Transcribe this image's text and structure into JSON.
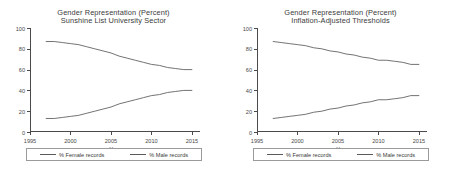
{
  "figure": {
    "background": "#ffffff",
    "line_color": "#5a5a5a",
    "axis_color": "#4a4a4a",
    "text_color": "#3a3a3a"
  },
  "panels": [
    {
      "id": "left",
      "title_line1": "Gender Representation (Percent)",
      "title_line2": "Sunshine List University Sector",
      "xlabel": "Year",
      "legend": [
        {
          "label": "% Female records"
        },
        {
          "label": "% Male records"
        }
      ]
    },
    {
      "id": "right",
      "title_line1": "Gender Representation (Percent)",
      "title_line2": "Inflation-Adjusted Thresholds",
      "xlabel": "Year",
      "legend": [
        {
          "label": "% Female records"
        },
        {
          "label": "% Male records"
        }
      ]
    }
  ],
  "chart_data": [
    {
      "type": "line",
      "title": "Gender Representation (Percent) — Sunshine List University Sector",
      "xlabel": "Year",
      "ylabel": "",
      "xlim": [
        1995,
        2016
      ],
      "ylim": [
        0,
        100
      ],
      "xticks": [
        1995,
        2000,
        2005,
        2010,
        2015
      ],
      "yticks": [
        0,
        20,
        40,
        60,
        80,
        100
      ],
      "grid": false,
      "legend_position": "bottom",
      "x": [
        1997,
        1998,
        1999,
        2000,
        2001,
        2002,
        2003,
        2004,
        2005,
        2006,
        2007,
        2008,
        2009,
        2010,
        2011,
        2012,
        2013,
        2014,
        2015
      ],
      "series": [
        {
          "name": "% Female records",
          "values": [
            87,
            87,
            86,
            85,
            84,
            82,
            80,
            78,
            76,
            73,
            71,
            69,
            67,
            65,
            64,
            62,
            61,
            60,
            60
          ]
        },
        {
          "name": "% Male records",
          "values": [
            13,
            13,
            14,
            15,
            16,
            18,
            20,
            22,
            24,
            27,
            29,
            31,
            33,
            35,
            36,
            38,
            39,
            40,
            40
          ]
        }
      ]
    },
    {
      "type": "line",
      "title": "Gender Representation (Percent) — Inflation-Adjusted Thresholds",
      "xlabel": "Year",
      "ylabel": "",
      "xlim": [
        1995,
        2016
      ],
      "ylim": [
        0,
        100
      ],
      "xticks": [
        1995,
        2000,
        2005,
        2010,
        2015
      ],
      "yticks": [
        0,
        20,
        40,
        60,
        80,
        100
      ],
      "grid": false,
      "legend_position": "bottom",
      "x": [
        1997,
        1998,
        1999,
        2000,
        2001,
        2002,
        2003,
        2004,
        2005,
        2006,
        2007,
        2008,
        2009,
        2010,
        2011,
        2012,
        2013,
        2014,
        2015
      ],
      "series": [
        {
          "name": "% Female records",
          "values": [
            87,
            86,
            85,
            84,
            83,
            81,
            80,
            78,
            77,
            75,
            74,
            72,
            71,
            69,
            69,
            68,
            67,
            65,
            65
          ]
        },
        {
          "name": "% Male records",
          "values": [
            13,
            14,
            15,
            16,
            17,
            19,
            20,
            22,
            23,
            25,
            26,
            28,
            29,
            31,
            31,
            32,
            33,
            35,
            35
          ]
        }
      ]
    }
  ]
}
